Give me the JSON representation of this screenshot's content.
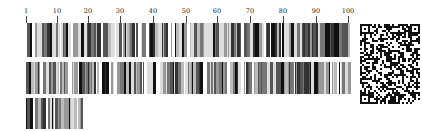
{
  "ruler": {
    "labels": [
      {
        "text": "1",
        "x": 26
      },
      {
        "text": "10",
        "x": 57
      },
      {
        "text": "20",
        "x": 88
      },
      {
        "text": "30",
        "x": 120
      },
      {
        "text": "40",
        "x": 153
      },
      {
        "text": "50",
        "x": 186
      },
      {
        "text": "60",
        "x": 217
      },
      {
        "text": "70",
        "x": 250
      },
      {
        "text": "80",
        "x": 283
      },
      {
        "text": "90",
        "x": 316
      },
      {
        "text": "100",
        "x": 348
      }
    ]
  },
  "barcode": {
    "rows": [
      {
        "name": "row-1",
        "left": 26,
        "top": 23,
        "width": 325,
        "height": 34,
        "seed": 7,
        "gaps": [
          [
            112,
            115
          ],
          [
            142,
            145
          ]
        ]
      },
      {
        "name": "row-2",
        "left": 26,
        "top": 62,
        "width": 325,
        "height": 32,
        "seed": 19,
        "gaps": [
          [
            130,
            133
          ],
          [
            178,
            181
          ]
        ]
      },
      {
        "name": "row-3",
        "left": 26,
        "top": 98,
        "width": 57,
        "height": 31,
        "seed": 31,
        "gaps": []
      }
    ],
    "colors": [
      "#111111",
      "#333333",
      "#555555",
      "#777777",
      "#999999",
      "#bbbbbb",
      "#dddddd",
      "#ffffff"
    ]
  },
  "qr_code": {
    "left": 360,
    "top": 24,
    "width": 60,
    "height": 80,
    "modules_x": 30,
    "modules_y": 40,
    "seed": 101,
    "dark": "#111111",
    "light": "#ffffff"
  }
}
